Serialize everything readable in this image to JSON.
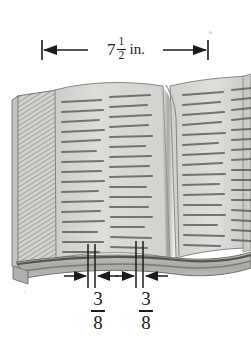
{
  "figure": {
    "width_px": 251,
    "height_px": 358,
    "background_color": "#ffffff",
    "ink_color": "#1b1b1b"
  },
  "annotations": {
    "top_dimension": {
      "name": "book-width",
      "whole": "7",
      "fraction_numerator": "1",
      "fraction_denominator": "2",
      "units": "in.",
      "full_text": "7 1/2 in.",
      "arrow_style": "double-headed-with-end-bars"
    },
    "bottom_left_dimension": {
      "name": "left-margin",
      "numerator": "3",
      "denominator": "8",
      "full_text": "3/8",
      "arrow_style": "inward-arrows"
    },
    "bottom_right_dimension": {
      "name": "right-margin",
      "numerator": "3",
      "denominator": "8",
      "full_text": "3/8",
      "arrow_style": "inward-arrows"
    }
  },
  "book": {
    "page_fill": "#d9d9d6",
    "page_fill_light": "#e6e6e3",
    "page_edge_fill": "#cfcfcb",
    "spine_shadow": "#8e8e8a",
    "base_fill": "#bdbdb9",
    "outline_color": "#6e6e6a",
    "text_line_color": "#5a5a57",
    "columns": [
      {
        "name": "column-1",
        "lines": 16
      },
      {
        "name": "column-2",
        "lines": 16
      },
      {
        "name": "column-3",
        "lines": 16
      },
      {
        "name": "column-4",
        "lines": 16
      }
    ]
  },
  "colors": {
    "ink": "#1b1b1b",
    "page": "#d9d9d6",
    "shadow": "#8e8e8a",
    "hatch": "#9a9a96"
  }
}
